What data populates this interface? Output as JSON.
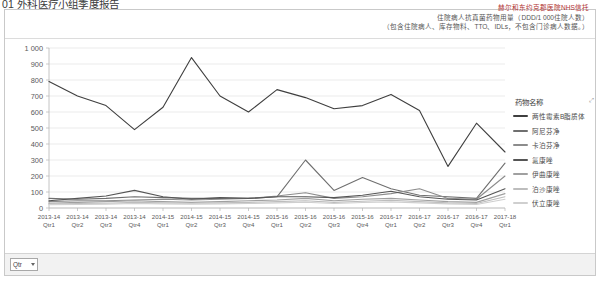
{
  "page": {
    "title": "01 外科医疗小组季度报告"
  },
  "header": {
    "lines": [
      "赫尔和东约克郡医院NHS信托",
      "住院病人抗真菌药物用量（DDD/1 000住院人数）",
      "（包含住院病人、库存物料、TTO、IDLs，不包含门诊病人数据。）"
    ]
  },
  "legend": {
    "title": "药物名称",
    "expand_icon": "expand-icon"
  },
  "footer": {
    "filter_label": "Qtr",
    "filter_icon": "chevron-down-icon"
  },
  "chart_data": {
    "type": "line",
    "title": "住院病人抗真菌药物用量（DDD/1 000住院人数）",
    "xlabel": "",
    "ylabel": "",
    "ylim": [
      0,
      1000
    ],
    "yticks": [
      0,
      100,
      200,
      300,
      400,
      500,
      600,
      700,
      800,
      900,
      1000
    ],
    "grid": true,
    "legend_position": "right",
    "categories": [
      "2013-14 Qtr1",
      "2013-14 Qtr2",
      "2013-14 Qtr3",
      "2013-14 Qtr4",
      "2014-15 Qtr1",
      "2014-15 Qtr2",
      "2014-15 Qtr3",
      "2014-15 Qtr4",
      "2015-16 Qtr1",
      "2015-16 Qtr2",
      "2015-16 Qtr3",
      "2015-16 Qtr4",
      "2016-17 Qtr1",
      "2016-17 Qtr2",
      "2016-17 Qtr3",
      "2016-17 Qtr4",
      "2017-18 Qtr1"
    ],
    "category_lines": [
      [
        "2013-14",
        "Qtr1"
      ],
      [
        "2013-14",
        "Qtr2"
      ],
      [
        "2013-14",
        "Qtr3"
      ],
      [
        "2013-14",
        "Qtr4"
      ],
      [
        "2014-15",
        "Qtr1"
      ],
      [
        "2014-15",
        "Qtr2"
      ],
      [
        "2014-15",
        "Qtr3"
      ],
      [
        "2014-15",
        "Qtr4"
      ],
      [
        "2015-16",
        "Qtr1"
      ],
      [
        "2015-16",
        "Qtr2"
      ],
      [
        "2015-16",
        "Qtr3"
      ],
      [
        "2015-16",
        "Qtr4"
      ],
      [
        "2016-17",
        "Qtr1"
      ],
      [
        "2016-17",
        "Qtr2"
      ],
      [
        "2016-17",
        "Qtr3"
      ],
      [
        "2016-17",
        "Qtr4"
      ],
      [
        "2017-18",
        "Qtr1"
      ]
    ],
    "series": [
      {
        "name": "两性霉素B脂质体",
        "color": "#3f3f3f",
        "values": [
          790,
          700,
          640,
          490,
          630,
          940,
          700,
          600,
          740,
          690,
          620,
          640,
          710,
          610,
          260,
          530,
          350
        ]
      },
      {
        "name": "阿尼芬净",
        "color": "#6f6f6f",
        "values": [
          60,
          55,
          60,
          70,
          65,
          60,
          60,
          60,
          70,
          300,
          110,
          190,
          120,
          80,
          70,
          60,
          280
        ]
      },
      {
        "name": "卡泊芬净",
        "color": "#8c8c8c",
        "values": [
          40,
          45,
          45,
          50,
          55,
          50,
          55,
          60,
          75,
          95,
          60,
          70,
          90,
          120,
          60,
          55,
          200
        ]
      },
      {
        "name": "氟康唑",
        "color": "#555555",
        "values": [
          45,
          60,
          75,
          110,
          70,
          55,
          65,
          60,
          70,
          70,
          65,
          80,
          105,
          70,
          55,
          50,
          120
        ]
      },
      {
        "name": "伊曲康唑",
        "color": "#a0a0a0",
        "values": [
          30,
          35,
          40,
          45,
          40,
          35,
          40,
          45,
          50,
          60,
          45,
          55,
          60,
          50,
          40,
          35,
          90
        ]
      },
      {
        "name": "泊沙康唑",
        "color": "#bdbdbd",
        "values": [
          25,
          28,
          30,
          35,
          32,
          30,
          32,
          35,
          40,
          45,
          35,
          42,
          48,
          40,
          32,
          28,
          70
        ]
      },
      {
        "name": "伏立康唑",
        "color": "#cfcfcf",
        "values": [
          20,
          22,
          24,
          28,
          26,
          24,
          26,
          28,
          32,
          36,
          28,
          34,
          38,
          32,
          26,
          22,
          55
        ]
      }
    ]
  }
}
